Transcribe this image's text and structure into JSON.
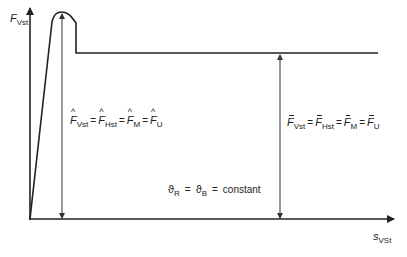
{
  "axes": {
    "y_label_main": "F",
    "y_label_sub": "Vst",
    "x_label_main": "s",
    "x_label_sub": "VSt"
  },
  "peak_equation": {
    "terms": [
      {
        "sym": "F",
        "sub": "Vst"
      },
      {
        "sym": "F",
        "sub": "Hst"
      },
      {
        "sym": "F",
        "sub": "M"
      },
      {
        "sym": "F",
        "sub": "U"
      }
    ],
    "eq": "=",
    "accent": "hat"
  },
  "mean_equation": {
    "terms": [
      {
        "sym": "F",
        "sub": "Vst"
      },
      {
        "sym": "F",
        "sub": "Hst"
      },
      {
        "sym": "F",
        "sub": "M"
      },
      {
        "sym": "F",
        "sub": "U"
      }
    ],
    "eq": "=",
    "accent": "bar"
  },
  "temperature_condition": {
    "sym1": "ϑ",
    "sub1": "R",
    "sym2": "ϑ",
    "sub2": "B",
    "eq": "=",
    "value": "constant"
  },
  "colors": {
    "line": "#222222",
    "arrow": "#333333",
    "background": "#ffffff"
  }
}
